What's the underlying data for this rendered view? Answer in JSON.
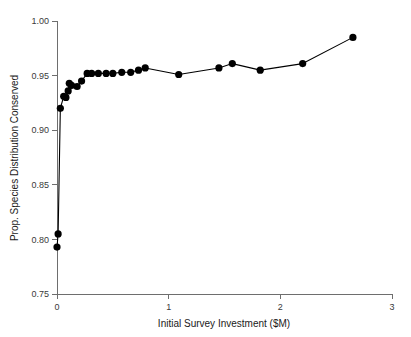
{
  "chart_data": {
    "type": "line",
    "title": "",
    "subtitle": "",
    "xlabel": "Initial Survey Investment ($M)",
    "ylabel": "Prop. Species Distribution Conserved",
    "xlim": [
      0,
      3
    ],
    "ylim": [
      0.75,
      1.0
    ],
    "xticks": [
      0,
      1,
      2,
      3
    ],
    "xtick_labels": [
      "0",
      "1",
      "2",
      "3"
    ],
    "yticks": [
      0.75,
      0.8,
      0.85,
      0.9,
      0.95,
      1.0
    ],
    "ytick_labels": [
      "0.75",
      "0.80",
      "0.85",
      "0.90",
      "0.95",
      "1.00"
    ],
    "grid": false,
    "legend": null,
    "legend_position": "none",
    "marker": "filled-circle",
    "marker_color": "#000000",
    "line_color": "#000000",
    "annotations": [],
    "x": [
      0.0,
      0.01,
      0.03,
      0.06,
      0.08,
      0.1,
      0.11,
      0.13,
      0.18,
      0.22,
      0.27,
      0.31,
      0.37,
      0.44,
      0.5,
      0.58,
      0.66,
      0.73,
      0.79,
      1.09,
      1.45,
      1.57,
      1.82,
      2.2,
      2.65
    ],
    "y": [
      0.793,
      0.805,
      0.92,
      0.931,
      0.93,
      0.936,
      0.943,
      0.941,
      0.94,
      0.945,
      0.952,
      0.952,
      0.952,
      0.952,
      0.952,
      0.953,
      0.953,
      0.955,
      0.957,
      0.951,
      0.957,
      0.961,
      0.955,
      0.961,
      0.985
    ],
    "series": [
      {
        "name": "Prop. Species Distribution Conserved",
        "x": [
          0.0,
          0.01,
          0.03,
          0.06,
          0.08,
          0.1,
          0.11,
          0.13,
          0.18,
          0.22,
          0.27,
          0.31,
          0.37,
          0.44,
          0.5,
          0.58,
          0.66,
          0.73,
          0.79,
          1.09,
          1.45,
          1.57,
          1.82,
          2.2,
          2.65
        ],
        "values": [
          0.793,
          0.805,
          0.92,
          0.931,
          0.93,
          0.936,
          0.943,
          0.941,
          0.94,
          0.945,
          0.952,
          0.952,
          0.952,
          0.952,
          0.952,
          0.953,
          0.953,
          0.955,
          0.957,
          0.951,
          0.957,
          0.961,
          0.955,
          0.961,
          0.985
        ]
      }
    ]
  },
  "figure": {
    "background_color": "#ffffff",
    "axis_color": "#6e6e6e",
    "text_color": "#1a1a1a"
  }
}
